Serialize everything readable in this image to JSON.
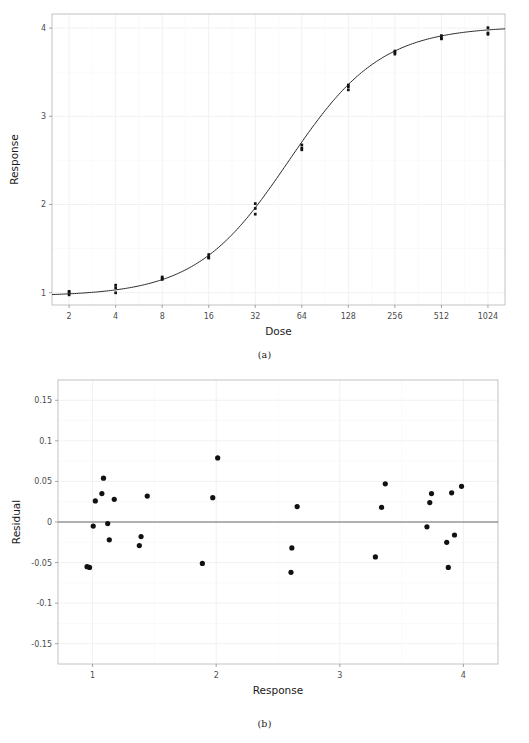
{
  "figure": {
    "panel_a_caption": "(a)",
    "panel_b_caption": "(b)"
  },
  "chart_data": [
    {
      "type": "scatter",
      "id": "panel-a",
      "title": "",
      "xlabel": "Dose",
      "ylabel": "Response",
      "xscale": "log2",
      "xticks": [
        2,
        4,
        8,
        16,
        32,
        64,
        128,
        256,
        512,
        1024
      ],
      "xtick_labels": [
        "2",
        "4",
        "8",
        "16",
        "32",
        "64",
        "128",
        "256",
        "512",
        "1024"
      ],
      "yticks": [
        1,
        2,
        3,
        4
      ],
      "ytick_labels": [
        "1",
        "2",
        "3",
        "4"
      ],
      "xlim": [
        1.55,
        1320
      ],
      "ylim": [
        0.86,
        4.16
      ],
      "grid": true,
      "legend": "none",
      "series": [
        {
          "name": "observed",
          "marker": "filled-square",
          "points": [
            {
              "dose": 2,
              "response": 1.015
            },
            {
              "dose": 2,
              "response": 1.005
            },
            {
              "dose": 2,
              "response": 0.975
            },
            {
              "dose": 4,
              "response": 1.085
            },
            {
              "dose": 4,
              "response": 1.055
            },
            {
              "dose": 4,
              "response": 0.998
            },
            {
              "dose": 8,
              "response": 1.178
            },
            {
              "dose": 8,
              "response": 1.163
            },
            {
              "dose": 8,
              "response": 1.15
            },
            {
              "dose": 16,
              "response": 1.432
            },
            {
              "dose": 16,
              "response": 1.4
            },
            {
              "dose": 16,
              "response": 1.392
            },
            {
              "dose": 32,
              "response": 2.01
            },
            {
              "dose": 32,
              "response": 1.955
            },
            {
              "dose": 32,
              "response": 1.89
            },
            {
              "dose": 64,
              "response": 2.675
            },
            {
              "dose": 64,
              "response": 2.64
            },
            {
              "dose": 64,
              "response": 2.62
            },
            {
              "dose": 128,
              "response": 3.355
            },
            {
              "dose": 128,
              "response": 3.335
            },
            {
              "dose": 128,
              "response": 3.3
            },
            {
              "dose": 256,
              "response": 3.74
            },
            {
              "dose": 256,
              "response": 3.725
            },
            {
              "dose": 256,
              "response": 3.705
            },
            {
              "dose": 512,
              "response": 3.915
            },
            {
              "dose": 512,
              "response": 3.885
            },
            {
              "dose": 512,
              "response": 3.878
            },
            {
              "dose": 1024,
              "response": 4.005
            },
            {
              "dose": 1024,
              "response": 3.945
            },
            {
              "dose": 1024,
              "response": 3.93
            }
          ]
        },
        {
          "name": "fitted-curve",
          "marker": "line",
          "model": "four-parameter-logistic",
          "params": {
            "lower": 0.96,
            "upper": 4.02,
            "ed50": 52.5,
            "slope": 1.45
          },
          "points": [
            {
              "dose": 2,
              "response": 1.0
            },
            {
              "dose": 2.8,
              "response": 1.018
            },
            {
              "dose": 4,
              "response": 1.047
            },
            {
              "dose": 5.7,
              "response": 1.09
            },
            {
              "dose": 8,
              "response": 1.16
            },
            {
              "dose": 11.3,
              "response": 1.265
            },
            {
              "dose": 16,
              "response": 1.42
            },
            {
              "dose": 22.6,
              "response": 1.65
            },
            {
              "dose": 32,
              "response": 1.96
            },
            {
              "dose": 45.3,
              "response": 2.345
            },
            {
              "dose": 64,
              "response": 2.66
            },
            {
              "dose": 90.5,
              "response": 3.065
            },
            {
              "dose": 128,
              "response": 3.345
            },
            {
              "dose": 181,
              "response": 3.57
            },
            {
              "dose": 256,
              "response": 3.73
            },
            {
              "dose": 362,
              "response": 3.835
            },
            {
              "dose": 512,
              "response": 3.9
            },
            {
              "dose": 724,
              "response": 3.945
            },
            {
              "dose": 1024,
              "response": 3.968
            }
          ]
        }
      ]
    },
    {
      "type": "scatter",
      "id": "panel-b",
      "title": "",
      "xlabel": "Response",
      "ylabel": "Residual",
      "xscale": "linear",
      "xticks": [
        1,
        2,
        3,
        4
      ],
      "xtick_labels": [
        "1",
        "2",
        "3",
        "4"
      ],
      "yticks": [
        0.15,
        0.1,
        0.05,
        0,
        -0.05,
        -0.1,
        -0.15
      ],
      "ytick_labels": [
        "0.15",
        "0.1",
        "0.05",
        "0",
        "-0.05",
        "-0.1",
        "-0.15"
      ],
      "xlim": [
        0.72,
        4.28
      ],
      "ylim": [
        -0.175,
        0.175
      ],
      "grid": true,
      "legend": "none",
      "reference_line_y": 0,
      "series": [
        {
          "name": "residuals",
          "marker": "filled-circle",
          "points": [
            {
              "x": 0.955,
              "y": -0.055
            },
            {
              "x": 0.975,
              "y": -0.056
            },
            {
              "x": 1.005,
              "y": -0.005
            },
            {
              "x": 1.022,
              "y": 0.026
            },
            {
              "x": 1.075,
              "y": 0.035
            },
            {
              "x": 1.088,
              "y": 0.054
            },
            {
              "x": 1.122,
              "y": -0.002
            },
            {
              "x": 1.135,
              "y": -0.022
            },
            {
              "x": 1.175,
              "y": 0.028
            },
            {
              "x": 1.378,
              "y": -0.029
            },
            {
              "x": 1.392,
              "y": -0.018
            },
            {
              "x": 1.442,
              "y": 0.032
            },
            {
              "x": 1.888,
              "y": -0.051
            },
            {
              "x": 1.972,
              "y": 0.03
            },
            {
              "x": 2.012,
              "y": 0.079
            },
            {
              "x": 2.605,
              "y": -0.062
            },
            {
              "x": 2.612,
              "y": -0.032
            },
            {
              "x": 2.655,
              "y": 0.019
            },
            {
              "x": 3.288,
              "y": -0.043
            },
            {
              "x": 3.338,
              "y": 0.018
            },
            {
              "x": 3.368,
              "y": 0.047
            },
            {
              "x": 3.705,
              "y": -0.006
            },
            {
              "x": 3.728,
              "y": 0.024
            },
            {
              "x": 3.742,
              "y": 0.035
            },
            {
              "x": 3.865,
              "y": -0.025
            },
            {
              "x": 3.878,
              "y": -0.056
            },
            {
              "x": 3.905,
              "y": 0.036
            },
            {
              "x": 3.928,
              "y": -0.016
            },
            {
              "x": 3.985,
              "y": 0.044
            }
          ]
        }
      ]
    }
  ]
}
